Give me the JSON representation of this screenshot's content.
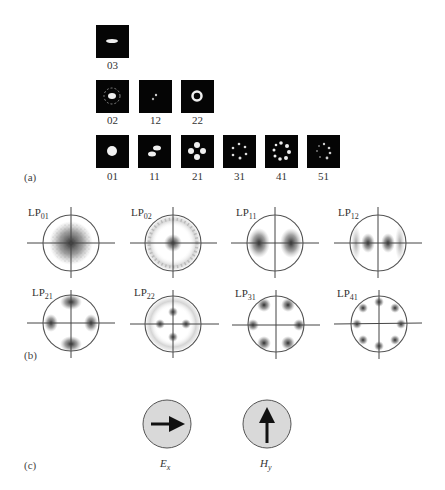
{
  "figure": {
    "panels": {
      "a": {
        "label": "(a)",
        "title": "Far-field mode images",
        "rows": [
          [
            {
              "id": "03",
              "label": "03"
            }
          ],
          [
            {
              "id": "02",
              "label": "02"
            },
            {
              "id": "12",
              "label": "12"
            },
            {
              "id": "22",
              "label": "22"
            }
          ],
          [
            {
              "id": "01",
              "label": "01"
            },
            {
              "id": "11",
              "label": "11"
            },
            {
              "id": "21",
              "label": "21"
            },
            {
              "id": "31",
              "label": "31"
            },
            {
              "id": "41",
              "label": "41"
            },
            {
              "id": "51",
              "label": "51"
            }
          ]
        ]
      },
      "b": {
        "label": "(b)",
        "modes": [
          {
            "prefix": "LP",
            "sub": "01"
          },
          {
            "prefix": "LP",
            "sub": "02"
          },
          {
            "prefix": "LP",
            "sub": "11"
          },
          {
            "prefix": "LP",
            "sub": "12"
          },
          {
            "prefix": "LP",
            "sub": "21"
          },
          {
            "prefix": "LP",
            "sub": "22"
          },
          {
            "prefix": "LP",
            "sub": "31"
          },
          {
            "prefix": "LP",
            "sub": "41"
          }
        ]
      },
      "c": {
        "label": "(c)",
        "fields": [
          {
            "symbol": "E",
            "sub": "x",
            "arrow": "right"
          },
          {
            "symbol": "H",
            "sub": "y",
            "arrow": "up"
          }
        ],
        "fill_color": "#d9d9d9"
      }
    }
  }
}
